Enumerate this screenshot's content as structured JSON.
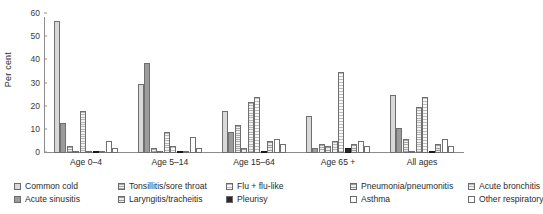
{
  "chart_data": {
    "type": "bar",
    "title": "",
    "xlabel": "",
    "ylabel": "Per cent",
    "ylim": [
      0,
      60
    ],
    "yticks": [
      0,
      10,
      20,
      30,
      40,
      50,
      60
    ],
    "grid": false,
    "legend_position": "bottom",
    "categories": [
      "Age 0–4",
      "Age 5–14",
      "Age 15–64",
      "Age 65 +",
      "All ages"
    ],
    "series": [
      {
        "name": "Common cold",
        "pattern": "solid-light",
        "color": "#d9d9d9",
        "values": [
          57,
          30,
          18,
          16,
          25
        ]
      },
      {
        "name": "Acute sinusitis",
        "pattern": "solid-mid",
        "color": "#9c9c9c",
        "values": [
          13,
          39,
          9,
          2,
          11
        ]
      },
      {
        "name": "Tonsillitis/sore throat",
        "pattern": "checks",
        "color": "#a8a8a8",
        "values": [
          3,
          2,
          12,
          4,
          6
        ]
      },
      {
        "name": "Laryngitis/tracheitis",
        "pattern": "dots",
        "color": "#9b9b9b",
        "values": [
          0,
          0,
          2,
          3,
          1
        ]
      },
      {
        "name": "Acute bronchitis",
        "pattern": "hgrid",
        "color": "#b6b6b6",
        "values": [
          18,
          9,
          22,
          5,
          20
        ]
      },
      {
        "name": "Flu + flu-like",
        "pattern": "vgrid",
        "color": "#bdbdbd",
        "values": [
          1,
          3,
          24,
          35,
          24
        ]
      },
      {
        "name": "Pleurisy",
        "pattern": "solid-dark",
        "color": "#2a2a2a",
        "values": [
          0,
          0,
          1,
          2,
          1
        ]
      },
      {
        "name": "Pneumonia/pneumonitis",
        "pattern": "dots",
        "color": "#9b9b9b",
        "values": [
          0,
          0,
          5,
          4,
          4
        ]
      },
      {
        "name": "Asthma",
        "pattern": "white",
        "color": "#ffffff",
        "values": [
          5,
          7,
          6,
          5,
          6
        ]
      },
      {
        "name": "Other respiratory",
        "pattern": "white",
        "color": "#ffffff",
        "values": [
          2,
          2,
          4,
          3,
          3
        ]
      }
    ]
  },
  "axis": {
    "y_title": "Per cent",
    "y_ticks": [
      "0",
      "10",
      "20",
      "30",
      "40",
      "50",
      "60"
    ]
  },
  "groups": [
    {
      "label": "Age 0–4"
    },
    {
      "label": "Age 5–14"
    },
    {
      "label": "Age 15–64"
    },
    {
      "label": "Age 65 +"
    },
    {
      "label": "All ages"
    }
  ],
  "legend": {
    "items": [
      {
        "label": "Common cold",
        "pattern": "p-solid-light"
      },
      {
        "label": "Acute sinusitis",
        "pattern": "p-solid-mid"
      },
      {
        "label": "Tonsillitis/sore throat",
        "pattern": "p-checks"
      },
      {
        "label": "Laryngitis/tracheitis",
        "pattern": "p-dots"
      },
      {
        "label": "Acute bronchitis",
        "pattern": "p-hgrid"
      },
      {
        "label": "Flu + flu-like",
        "pattern": "p-vgrid"
      },
      {
        "label": "Pleurisy",
        "pattern": "p-solid-dark"
      },
      {
        "label": "Pneumonia/pneumonitis",
        "pattern": "p-dots"
      },
      {
        "label": "Asthma",
        "pattern": "p-white"
      },
      {
        "label": "Other respiratory",
        "pattern": "p-white"
      }
    ]
  }
}
